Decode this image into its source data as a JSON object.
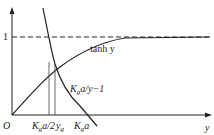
{
  "diagram": {
    "axes": {
      "origin_label": "O",
      "x_label": "y",
      "y_tick_label": "1"
    },
    "curves": {
      "tanh": {
        "label": "tanh y"
      },
      "hyperbola": {
        "label_main": "K",
        "label_sub": "g",
        "label_rest": "a/y−1"
      }
    },
    "x_ticks": {
      "half": {
        "main": "K",
        "sub": "g",
        "rest": "a/2"
      },
      "yg": {
        "main": "y",
        "sub": "g"
      },
      "kga": {
        "main": "K",
        "sub": "g",
        "rest": "a"
      }
    },
    "asymptote": {
      "value": "1",
      "style": "dashed"
    }
  }
}
